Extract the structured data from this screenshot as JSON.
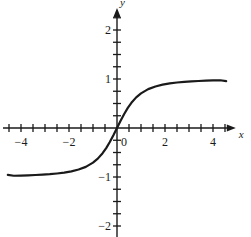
{
  "figure": {
    "background": "#ffffff",
    "ink": "#1a1a1a",
    "axis_label_x": "x",
    "axis_label_y": "y"
  },
  "chart_data": {
    "type": "line",
    "title": "",
    "xlabel": "x",
    "ylabel": "y",
    "grid": false,
    "legend": false,
    "xlim": [
      -4.75,
      4.95
    ],
    "ylim": [
      -2.45,
      2.45
    ],
    "x_tick_labels": [
      "-4",
      "-2",
      "0",
      "2",
      "4"
    ],
    "x_tick_label_values": [
      -4,
      -2,
      0,
      2,
      4
    ],
    "y_tick_labels": [
      "2",
      "1",
      "-1",
      "-2"
    ],
    "y_tick_label_values": [
      2,
      1,
      -1,
      -2
    ],
    "x_minor_tick_step": 0.5,
    "y_minor_tick_step": 0.25,
    "series": [
      {
        "name": "sigmoid",
        "color": "#1a1a1a",
        "linewidth": 2.2,
        "x": [
          -4.55,
          -4.3,
          -4.0,
          -3.7,
          -3.4,
          -3.1,
          -2.8,
          -2.5,
          -2.2,
          -1.9,
          -1.6,
          -1.3,
          -1.0,
          -0.8,
          -0.6,
          -0.45,
          -0.3,
          -0.15,
          0.0,
          0.15,
          0.3,
          0.45,
          0.6,
          0.8,
          1.0,
          1.3,
          1.6,
          1.9,
          2.2,
          2.5,
          2.8,
          3.1,
          3.4,
          3.7,
          4.0,
          4.3,
          4.55
        ],
        "y": [
          -0.956,
          -0.974,
          -0.97,
          -0.965,
          -0.959,
          -0.951,
          -0.942,
          -0.928,
          -0.911,
          -0.885,
          -0.848,
          -0.793,
          -0.707,
          -0.625,
          -0.514,
          -0.41,
          -0.287,
          -0.148,
          0.0,
          0.148,
          0.287,
          0.41,
          0.514,
          0.625,
          0.707,
          0.793,
          0.848,
          0.885,
          0.911,
          0.928,
          0.942,
          0.951,
          0.959,
          0.965,
          0.97,
          0.974,
          0.956
        ]
      }
    ],
    "annotations": [
      {
        "text": "horizontal asymptote y = 1 (approached as x increases)"
      },
      {
        "text": "horizontal asymptote y = -1 (approached as x decreases)"
      },
      {
        "text": "passes through origin (0, 0)"
      }
    ]
  },
  "labels": {
    "x_ticks": [
      {
        "text": "-4",
        "x": -4
      },
      {
        "text": "-2",
        "x": -2
      },
      {
        "text": "0",
        "x": 0
      },
      {
        "text": "2",
        "x": 2
      },
      {
        "text": "4",
        "x": 4
      }
    ],
    "y_ticks": [
      {
        "text": "2",
        "y": 2
      },
      {
        "text": "1",
        "y": 1
      },
      {
        "text": "-1",
        "y": -1
      },
      {
        "text": "-2",
        "y": -2
      }
    ]
  }
}
